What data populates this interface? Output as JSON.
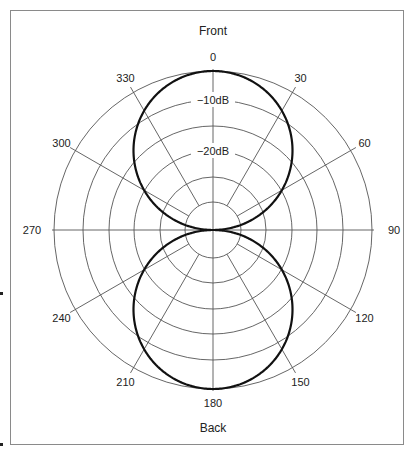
{
  "chart_data": {
    "type": "polar",
    "pattern": "figure-8 (bidirectional)",
    "top_label": "Front",
    "bottom_label": "Back",
    "angle_ticks": [
      0,
      30,
      60,
      90,
      120,
      150,
      180,
      210,
      240,
      270,
      300,
      330
    ],
    "angle_labels": [
      "0",
      "30",
      "60",
      "90",
      "120",
      "150",
      "180",
      "210",
      "240",
      "270",
      "300",
      "330"
    ],
    "ring_count": 6,
    "ring_labels": [
      {
        "ring": "second from outside",
        "text": "−10dB"
      },
      {
        "ring": "fourth from outside",
        "text": "−20dB"
      }
    ],
    "response": {
      "description": "Equal sensitivity front (0°) and back (180°), null at 90° and 270°",
      "formula": "|cos(theta)|",
      "max_at_deg": [
        0,
        180
      ],
      "null_at_deg": [
        90,
        270
      ]
    },
    "colors": {
      "grid": "#555555",
      "pattern": "#111111",
      "text": "#222222",
      "frame": "#8a8a8a"
    }
  }
}
